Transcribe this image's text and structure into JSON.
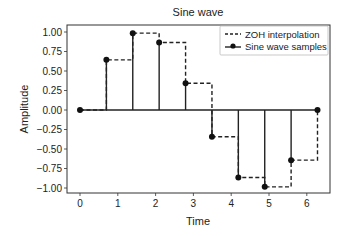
{
  "chart_data": {
    "type": "line",
    "title": "Sine wave",
    "xlabel": "Time",
    "ylabel": "Amplitude",
    "xlim": [
      -0.31,
      6.59
    ],
    "ylim": [
      -1.1,
      1.1
    ],
    "x_ticks": [
      0,
      1,
      2,
      3,
      4,
      5,
      6
    ],
    "x_tick_labels": [
      "0",
      "1",
      "2",
      "3",
      "4",
      "5",
      "6"
    ],
    "y_ticks": [
      1.0,
      0.75,
      0.5,
      0.25,
      0.0,
      -0.25,
      -0.5,
      -0.75,
      -1.0
    ],
    "y_tick_labels": [
      "1.00",
      "0.75",
      "0.50",
      "0.25",
      "0.00",
      "−0.25",
      "−0.50",
      "−0.75",
      "−1.00"
    ],
    "grid": false,
    "legend_position": "upper right",
    "x": [
      0.0,
      0.698,
      1.396,
      2.094,
      2.793,
      3.491,
      4.189,
      4.887,
      5.585,
      6.283
    ],
    "series": [
      {
        "name": "ZOH interpolation",
        "style": "dashed-step-post",
        "values": [
          0.0,
          0.643,
          0.985,
          0.866,
          0.342,
          -0.342,
          -0.866,
          -0.985,
          -0.643,
          0.0
        ]
      },
      {
        "name": "Sine wave samples",
        "style": "stem",
        "values": [
          0.0,
          0.643,
          0.985,
          0.866,
          0.342,
          -0.342,
          -0.866,
          -0.985,
          -0.643,
          0.0
        ]
      }
    ]
  }
}
